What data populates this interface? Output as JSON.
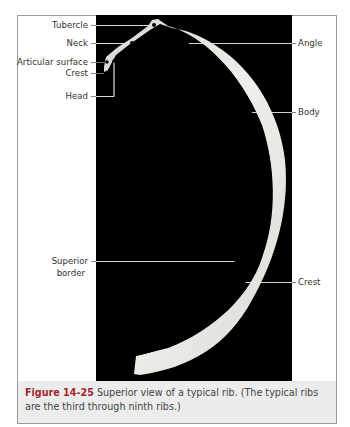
{
  "figure": {
    "number": "Figure 14-25",
    "caption": "Superior view of a typical rib. (The typical ribs are the third through ninth ribs.)",
    "colors": {
      "accent": "#a0262a",
      "photo_bg": "#000000",
      "caption_bg": "#ececec",
      "bone": "#e6e6e0"
    }
  },
  "labels": {
    "tubercle": "Tubercle",
    "neck": "Neck",
    "articular_surface": "Articular surface",
    "crest_left": "Crest",
    "head": "Head",
    "angle": "Angle",
    "body": "Body",
    "superior_border_1": "Superior",
    "superior_border_2": "border",
    "crest_right": "Crest"
  }
}
